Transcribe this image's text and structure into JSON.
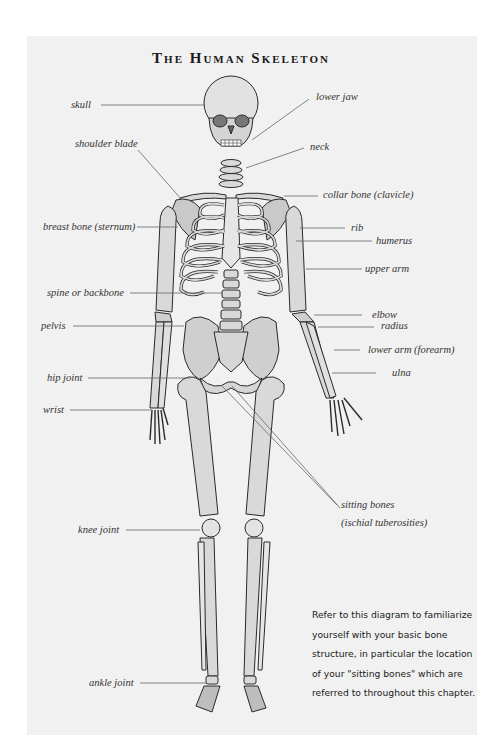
{
  "title": "The Human Skeleton",
  "labels": {
    "skull": "skull",
    "shoulder_blade": "shoulder blade",
    "breast_bone": "breast bone (sternum)",
    "spine": "spine or backbone",
    "pelvis": "pelvis",
    "hip_joint": "hip joint",
    "wrist": "wrist",
    "knee_joint": "knee joint",
    "ankle_joint": "ankle joint",
    "lower_jaw": "lower jaw",
    "neck": "neck",
    "collar_bone": "collar bone (clavicle)",
    "rib": "rib",
    "humerus": "humerus",
    "upper_arm": "upper arm",
    "elbow": "elbow",
    "radius": "radius",
    "lower_arm": "lower arm (forearm)",
    "ulna": "ulna",
    "sitting_bones_1": "sitting bones",
    "sitting_bones_2": "(ischial tuberosities)"
  },
  "note": {
    "lines": [
      "Refer to this diagram to familiarize",
      "yourself with your basic bone",
      "structure, in particular the location",
      "of your \"sitting bones\" which are",
      "referred to throughout this chapter."
    ]
  },
  "colors": {
    "panel": "#f1f1f1",
    "bone_fill": "#d9d9d9",
    "bone_shade": "#bdbdbd",
    "outline": "#2a2a2a",
    "leader": "#666666"
  }
}
